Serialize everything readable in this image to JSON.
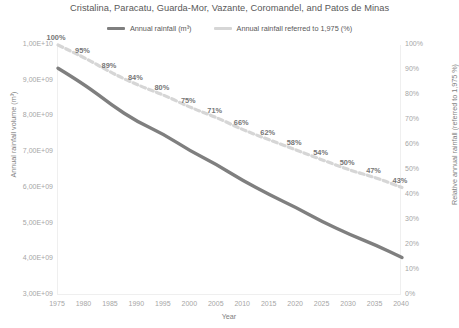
{
  "chart_data": {
    "type": "line",
    "title": "Cristalina, Paracatu, Guarda-Mor, Vazante, Coromandel, and Patos de Minas",
    "xlabel": "Year",
    "ylabel": "Annual rainfall volume (m³)",
    "y2label": "Relative annual rainfall (referred to 1,975 %)",
    "grid": false,
    "legend_position": "top-center",
    "x": [
      1975,
      1980,
      1985,
      1990,
      1995,
      2000,
      2005,
      2010,
      2015,
      2020,
      2025,
      2030,
      2035,
      2040
    ],
    "xlim": [
      1975,
      2040
    ],
    "ylim": [
      3000000000.0,
      10000000000.0
    ],
    "y2lim": [
      0,
      100
    ],
    "xticklabels": [
      "1975",
      "1980",
      "1985",
      "1990",
      "1995",
      "2000",
      "2005",
      "2010",
      "2015",
      "2020",
      "2025",
      "2030",
      "2035",
      "2040"
    ],
    "yticklabels": [
      "1,00E+10",
      "9,00E+09",
      "8,00E+09",
      "7,00E+09",
      "6,00E+09",
      "5,00E+09",
      "4,00E+09",
      "3,00E+09"
    ],
    "ytickvalues": [
      10000000000.0,
      9000000000.0,
      8000000000.0,
      7000000000.0,
      6000000000.0,
      5000000000.0,
      4000000000.0,
      3000000000.0
    ],
    "y2ticklabels": [
      "100%",
      "90%",
      "80%",
      "70%",
      "60%",
      "50%",
      "40%",
      "30%",
      "20%",
      "10%",
      "0%"
    ],
    "y2tickvalues": [
      100,
      90,
      80,
      70,
      60,
      50,
      40,
      30,
      20,
      10,
      0
    ],
    "series": [
      {
        "name": "Annual rainfall (m³)",
        "axis": "left",
        "color": "#7f7f7f",
        "style": "solid",
        "width": 3.4,
        "values": [
          9350000000.0,
          8900000000.0,
          8330000000.0,
          7850000000.0,
          7500000000.0,
          7030000000.0,
          6650000000.0,
          6200000000.0,
          5800000000.0,
          5450000000.0,
          5050000000.0,
          4700000000.0,
          4400000000.0,
          4050000000.0
        ],
        "labels": []
      },
      {
        "name": "Annual rainfall referred to 1,975 (%)",
        "axis": "right",
        "color": "#d6d6d6",
        "style": "dashed",
        "width": 3.2,
        "values": [
          100,
          95,
          89,
          84,
          80,
          75,
          71,
          66,
          62,
          58,
          54,
          50,
          47,
          43
        ],
        "labels": [
          "100%",
          "95%",
          "89%",
          "84%",
          "80%",
          "75%",
          "71%",
          "66%",
          "62%",
          "58%",
          "54%",
          "50%",
          "47%",
          "43%"
        ]
      }
    ]
  },
  "legend": {
    "items": [
      {
        "label": "Annual rainfall (m³)",
        "swatch": "solid"
      },
      {
        "label": "Annual rainfall referred to 1,975 (%)",
        "swatch": "dashed"
      }
    ]
  },
  "colors": {
    "solid_series": "#7f7f7f",
    "dashed_series": "#d6d6d6",
    "text": "#595959",
    "tick_text": "#a6a6a6",
    "axis_title": "#808080",
    "plot_border": "#efefef",
    "background": "#ffffff"
  }
}
